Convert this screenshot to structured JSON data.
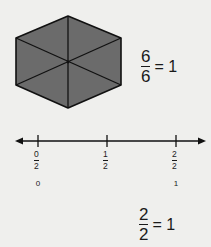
{
  "hexagon": {
    "fill": "#6b6b6b",
    "stroke": "#111111",
    "parts": 6,
    "shaded": 6
  },
  "hexagon_equation": {
    "numerator": "6",
    "denominator": "6",
    "rest": "= 1"
  },
  "number_line": {
    "ticks": [
      {
        "numerator": "0",
        "denominator": "2",
        "whole": "0"
      },
      {
        "numerator": "1",
        "denominator": "2",
        "whole": ""
      },
      {
        "numerator": "2",
        "denominator": "2",
        "whole": "1"
      }
    ]
  },
  "bottom_equation": {
    "numerator": "2",
    "denominator": "2",
    "rest": "= 1"
  }
}
